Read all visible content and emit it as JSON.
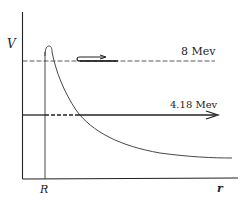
{
  "diagram": {
    "type": "potential-barrier",
    "axes": {
      "y_label": "V",
      "x_label": "r",
      "x_marker_label": "R"
    },
    "levels": [
      {
        "label": "8 Mev",
        "style": "dashed",
        "note": "reflected particle arrow"
      },
      {
        "label": "4.18 Mev",
        "style": "solid-with-dashed-tunnel",
        "note": "transmitted particle arrow"
      }
    ],
    "colors": {
      "ink": "#222222",
      "background": "#ffffff"
    }
  }
}
